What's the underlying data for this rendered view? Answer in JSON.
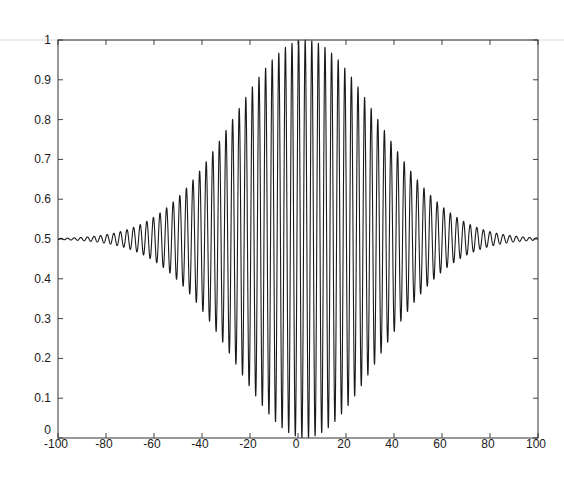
{
  "chart_data": {
    "type": "line",
    "title": "",
    "xlabel": "",
    "ylabel": "",
    "xlim": [
      -100,
      100
    ],
    "ylim": [
      0,
      1
    ],
    "grid": false,
    "legend": null,
    "x_ticks": [
      -100,
      -80,
      -60,
      -40,
      -20,
      0,
      20,
      40,
      60,
      80,
      100
    ],
    "x_tick_labels": [
      "-100",
      "-80",
      "-60",
      "-40",
      "-20",
      "0",
      "20",
      "40",
      "60",
      "80",
      "100"
    ],
    "y_ticks": [
      0,
      0.1,
      0.2,
      0.3,
      0.4,
      0.5,
      0.6,
      0.7,
      0.8,
      0.9,
      1
    ],
    "y_tick_labels": [
      "0",
      "0.1",
      "0.2",
      "0.3",
      "0.4",
      "0.5",
      "0.6",
      "0.7",
      "0.8",
      "0.9",
      "1"
    ],
    "series": [
      {
        "name": "signal",
        "description": "Gaussian-modulated cosine oscillating about 0.5",
        "model": "y = 0.5 + A*exp(-((x-x0)^2)/(2*sigma^2))*cos(2*pi*(x-x0)/period)",
        "params": {
          "baseline": 0.5,
          "A": 0.5,
          "x0": 3,
          "sigma": 30,
          "period": 2.75
        },
        "approx_envelope_points": [
          {
            "x": -100,
            "upper": 0.51,
            "lower": 0.49
          },
          {
            "x": -60,
            "upper": 0.53,
            "lower": 0.47
          },
          {
            "x": -40,
            "upper": 0.6,
            "lower": 0.4
          },
          {
            "x": -20,
            "upper": 0.72,
            "lower": 0.28
          },
          {
            "x": 0,
            "upper": 0.98,
            "lower": 0.02
          },
          {
            "x": 20,
            "upper": 0.72,
            "lower": 0.28
          },
          {
            "x": 40,
            "upper": 0.6,
            "lower": 0.4
          },
          {
            "x": 60,
            "upper": 0.53,
            "lower": 0.47
          },
          {
            "x": 100,
            "upper": 0.51,
            "lower": 0.49
          }
        ],
        "color": "#1a1a1a"
      }
    ]
  },
  "layout": {
    "plot": {
      "left": 58,
      "top": 40,
      "right": 538,
      "bottom": 438
    }
  }
}
